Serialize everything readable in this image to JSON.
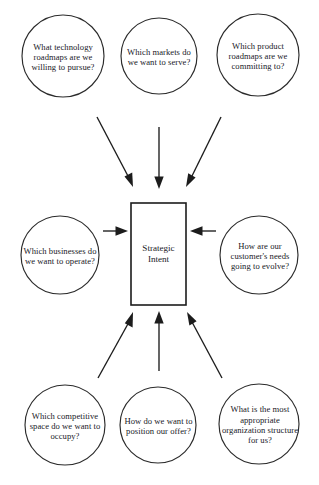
{
  "diagram": {
    "type": "hub-and-spoke",
    "title": "Strategic Intent",
    "center": {
      "label": "Strategic Intent",
      "shape": "rectangle"
    },
    "nodes": [
      {
        "id": "technology-roadmaps",
        "label": "What technology roadmaps are we willing to pursue?",
        "position": "top-left",
        "shape": "circle"
      },
      {
        "id": "markets-to-serve",
        "label": "Which markets do we want to serve?",
        "position": "top-center",
        "shape": "circle"
      },
      {
        "id": "product-roadmaps",
        "label": "Which product roadmaps are we committing to?",
        "position": "top-right",
        "shape": "circle"
      },
      {
        "id": "businesses-to-operate",
        "label": "Which businesses do we want to operate?",
        "position": "middle-left",
        "shape": "circle"
      },
      {
        "id": "customer-needs",
        "label": "How are our customer's needs going to evolve?",
        "position": "middle-right",
        "shape": "circle"
      },
      {
        "id": "competitive-space",
        "label": "Which competitive space do we want to occupy?",
        "position": "bottom-left",
        "shape": "circle"
      },
      {
        "id": "position-offer",
        "label": "How do we want to position our offer?",
        "position": "bottom-center",
        "shape": "circle"
      },
      {
        "id": "organization-structure",
        "label": "What is the most appropriate organization structure for us?",
        "position": "bottom-right",
        "shape": "circle"
      }
    ],
    "edges": [
      {
        "from": "technology-roadmaps",
        "to": "center",
        "direction": "inward"
      },
      {
        "from": "markets-to-serve",
        "to": "center",
        "direction": "inward"
      },
      {
        "from": "product-roadmaps",
        "to": "center",
        "direction": "inward"
      },
      {
        "from": "businesses-to-operate",
        "to": "center",
        "direction": "inward"
      },
      {
        "from": "customer-needs",
        "to": "center",
        "direction": "inward"
      },
      {
        "from": "competitive-space",
        "to": "center",
        "direction": "inward"
      },
      {
        "from": "position-offer",
        "to": "center",
        "direction": "inward"
      },
      {
        "from": "organization-structure",
        "to": "center",
        "direction": "inward"
      }
    ],
    "colors": {
      "background": "#ffffff",
      "stroke": "#1c1c1c",
      "circle_stroke": "#2b2b2b",
      "text": "#20201f"
    }
  }
}
